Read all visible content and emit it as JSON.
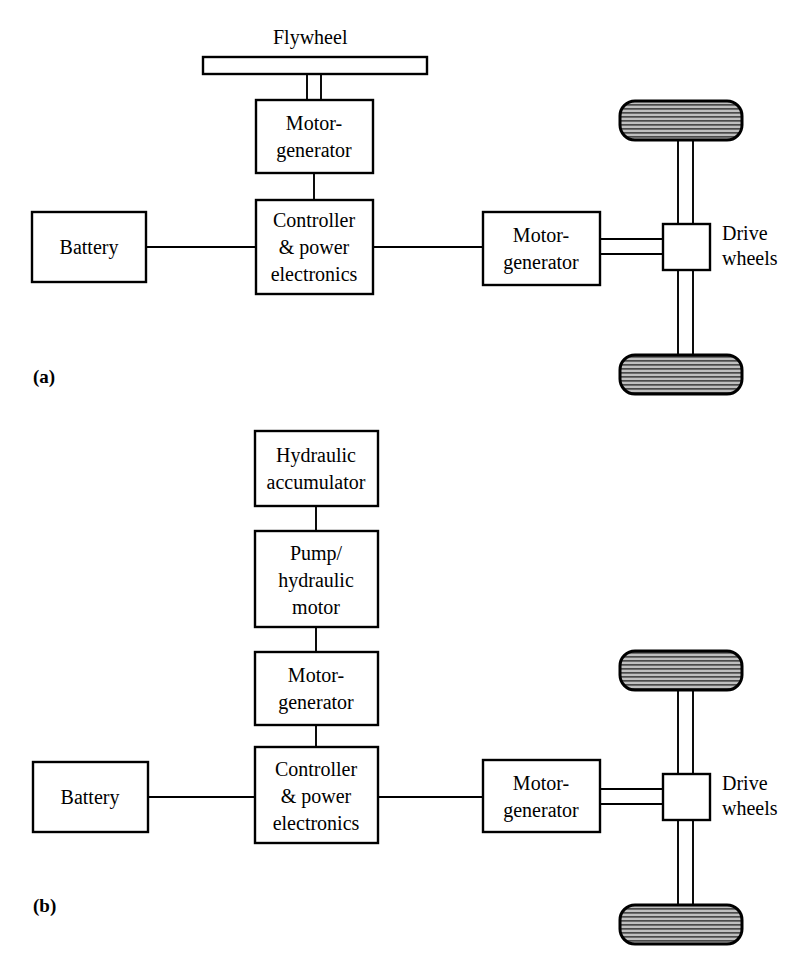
{
  "figure": {
    "background_color": "#ffffff",
    "line_color": "#000000",
    "box_fill": "#ffffff",
    "tire_fill": "#b4b4b4"
  },
  "panels": [
    {
      "id": "a",
      "caption": "(a)",
      "description": "Flywheel hybrid electric drivetrain",
      "blocks": [
        {
          "name": "flywheel-label",
          "text": "Flywheel"
        },
        {
          "name": "flywheel-bar",
          "text": ""
        },
        {
          "name": "motor-generator-top",
          "lines": [
            "Motor-",
            "generator"
          ]
        },
        {
          "name": "controller",
          "lines": [
            "Controller",
            "& power",
            "electronics"
          ]
        },
        {
          "name": "battery",
          "lines": [
            "Battery"
          ]
        },
        {
          "name": "motor-generator-right",
          "lines": [
            "Motor-",
            "generator"
          ]
        },
        {
          "name": "differential",
          "lines": []
        },
        {
          "name": "drive-wheels-label",
          "lines": [
            "Drive",
            "wheels"
          ]
        }
      ]
    },
    {
      "id": "b",
      "caption": "(b)",
      "description": "Hydraulic accumulator hybrid electric drivetrain",
      "blocks": [
        {
          "name": "hydraulic-accumulator",
          "lines": [
            "Hydraulic",
            "accumulator"
          ]
        },
        {
          "name": "pump-hydraulic-motor",
          "lines": [
            "Pump/",
            "hydraulic",
            "motor"
          ]
        },
        {
          "name": "motor-generator-stack",
          "lines": [
            "Motor-",
            "generator"
          ]
        },
        {
          "name": "controller",
          "lines": [
            "Controller",
            "& power",
            "electronics"
          ]
        },
        {
          "name": "battery",
          "lines": [
            "Battery"
          ]
        },
        {
          "name": "motor-generator-right",
          "lines": [
            "Motor-",
            "generator"
          ]
        },
        {
          "name": "differential",
          "lines": []
        },
        {
          "name": "drive-wheels-label",
          "lines": [
            "Drive",
            "wheels"
          ]
        }
      ]
    }
  ],
  "labels": {
    "flywheel": "Flywheel",
    "motor_generator_l1": "Motor-",
    "motor_generator_l2": "generator",
    "controller_l1": "Controller",
    "controller_l2": "& power",
    "controller_l3": "electronics",
    "battery": "Battery",
    "drive_l1": "Drive",
    "drive_l2": "wheels",
    "hydraulic_l1": "Hydraulic",
    "hydraulic_l2": "accumulator",
    "pump_l1": "Pump/",
    "pump_l2": "hydraulic",
    "pump_l3": "motor",
    "caption_a": "(a)",
    "caption_b": "(b)"
  }
}
